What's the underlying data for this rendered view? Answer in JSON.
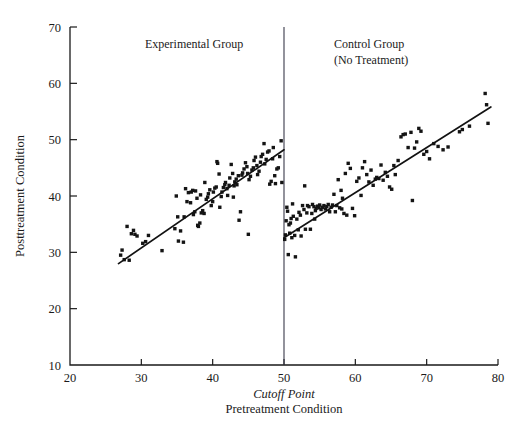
{
  "chart_data": {
    "type": "scatter",
    "title": "",
    "xlabel": "Pretreatment Condition",
    "ylabel": "Posttreatment Condition",
    "xlim": [
      20,
      80
    ],
    "ylim": [
      10,
      70
    ],
    "xticks": [
      20,
      30,
      40,
      50,
      60,
      70,
      80
    ],
    "yticks": [
      10,
      20,
      30,
      40,
      50,
      60,
      70
    ],
    "grid": false,
    "legend": "none",
    "cutoff": {
      "value": 50,
      "label": "Cutoff Point",
      "style": "italic",
      "color": "#3a3a4a"
    },
    "annotations": [
      {
        "text": "Experimental Group",
        "x": 30.5,
        "y": 66.2
      },
      {
        "text": "Control Group",
        "x": 57.0,
        "y": 66.2
      },
      {
        "text": "(No Treatment)",
        "x": 57.0,
        "y": 63.4
      }
    ],
    "marker": {
      "shape": "square",
      "size_px": 3.4,
      "color": "#141414"
    },
    "fit_lines": [
      {
        "name": "Experimental Group fit",
        "x0": 26.8,
        "y0": 28.0,
        "x1": 50.0,
        "y1": 48.2,
        "color": "#121212"
      },
      {
        "name": "Control Group fit",
        "x0": 50.0,
        "y0": 32.6,
        "x1": 79.0,
        "y1": 55.8,
        "color": "#121212"
      }
    ],
    "series": [
      {
        "name": "Experimental Group",
        "color": "#141414",
        "points": [
          [
            27.1,
            29.5
          ],
          [
            27.3,
            30.4
          ],
          [
            27.6,
            28.7
          ],
          [
            28.0,
            34.6
          ],
          [
            28.3,
            28.6
          ],
          [
            28.6,
            33.3
          ],
          [
            28.9,
            33.9
          ],
          [
            29.1,
            33.2
          ],
          [
            29.4,
            32.9
          ],
          [
            30.2,
            31.6
          ],
          [
            30.6,
            31.9
          ],
          [
            31.0,
            33.0
          ],
          [
            32.9,
            30.3
          ],
          [
            34.7,
            34.2
          ],
          [
            34.9,
            40.0
          ],
          [
            35.1,
            36.3
          ],
          [
            35.2,
            32.0
          ],
          [
            35.5,
            33.8
          ],
          [
            35.9,
            31.8
          ],
          [
            36.0,
            36.3
          ],
          [
            36.4,
            39.0
          ],
          [
            36.6,
            40.6
          ],
          [
            36.9,
            38.8
          ],
          [
            37.0,
            40.7
          ],
          [
            37.2,
            41.0
          ],
          [
            37.3,
            36.7
          ],
          [
            37.5,
            37.2
          ],
          [
            37.6,
            40.9
          ],
          [
            37.8,
            39.6
          ],
          [
            37.9,
            34.8
          ],
          [
            38.0,
            34.6
          ],
          [
            38.2,
            35.2
          ],
          [
            38.4,
            37.0
          ],
          [
            38.6,
            37.4
          ],
          [
            38.8,
            36.9
          ],
          [
            38.9,
            42.4
          ],
          [
            39.1,
            39.4
          ],
          [
            39.3,
            39.8
          ],
          [
            39.4,
            40.4
          ],
          [
            39.6,
            41.1
          ],
          [
            39.8,
            38.3
          ],
          [
            40.0,
            39.0
          ],
          [
            40.1,
            40.7
          ],
          [
            40.3,
            41.4
          ],
          [
            40.5,
            41.6
          ],
          [
            40.6,
            46.1
          ],
          [
            40.7,
            45.8
          ],
          [
            40.9,
            43.9
          ],
          [
            41.0,
            38.0
          ],
          [
            41.2,
            39.9
          ],
          [
            41.3,
            40.7
          ],
          [
            41.5,
            41.5
          ],
          [
            41.7,
            42.0
          ],
          [
            41.8,
            42.4
          ],
          [
            42.0,
            41.3
          ],
          [
            42.1,
            40.1
          ],
          [
            42.3,
            41.9
          ],
          [
            42.4,
            43.2
          ],
          [
            42.6,
            45.6
          ],
          [
            42.8,
            44.0
          ],
          [
            43.0,
            41.8
          ],
          [
            43.1,
            42.5
          ],
          [
            43.3,
            43.0
          ],
          [
            43.4,
            42.0
          ],
          [
            43.6,
            43.6
          ],
          [
            43.7,
            35.7
          ],
          [
            43.9,
            37.2
          ],
          [
            44.1,
            43.7
          ],
          [
            44.2,
            44.1
          ],
          [
            44.4,
            44.8
          ],
          [
            44.6,
            45.9
          ],
          [
            44.8,
            45.2
          ],
          [
            45.0,
            33.2
          ],
          [
            45.1,
            42.9
          ],
          [
            45.3,
            43.5
          ],
          [
            45.5,
            44.6
          ],
          [
            45.7,
            45.0
          ],
          [
            45.8,
            46.3
          ],
          [
            46.0,
            46.9
          ],
          [
            46.2,
            45.4
          ],
          [
            46.3,
            43.8
          ],
          [
            46.5,
            44.4
          ],
          [
            46.7,
            46.0
          ],
          [
            46.8,
            47.0
          ],
          [
            47.0,
            47.4
          ],
          [
            47.2,
            49.3
          ],
          [
            47.3,
            45.7
          ],
          [
            47.5,
            46.5
          ],
          [
            47.7,
            47.8
          ],
          [
            47.9,
            48.0
          ],
          [
            48.0,
            42.1
          ],
          [
            48.2,
            42.6
          ],
          [
            48.4,
            46.6
          ],
          [
            48.5,
            48.6
          ],
          [
            48.7,
            43.6
          ],
          [
            48.8,
            42.2
          ],
          [
            49.0,
            44.8
          ],
          [
            49.2,
            45.0
          ],
          [
            49.4,
            47.0
          ],
          [
            49.6,
            49.8
          ],
          [
            49.7,
            42.4
          ],
          [
            36.2,
            41.3
          ],
          [
            38.3,
            40.2
          ],
          [
            42.9,
            39.8
          ],
          [
            44.9,
            44.0
          ]
        ]
      },
      {
        "name": "Control Group (No Treatment)",
        "color": "#141414",
        "points": [
          [
            50.1,
            32.3
          ],
          [
            50.2,
            33.1
          ],
          [
            50.3,
            35.6
          ],
          [
            50.4,
            38.0
          ],
          [
            50.5,
            37.3
          ],
          [
            50.6,
            29.6
          ],
          [
            50.8,
            33.4
          ],
          [
            50.9,
            35.2
          ],
          [
            51.0,
            36.0
          ],
          [
            51.2,
            38.6
          ],
          [
            51.3,
            36.4
          ],
          [
            51.5,
            33.0
          ],
          [
            51.6,
            29.2
          ],
          [
            51.8,
            35.9
          ],
          [
            52.0,
            34.0
          ],
          [
            52.1,
            37.1
          ],
          [
            52.3,
            36.6
          ],
          [
            52.4,
            32.9
          ],
          [
            52.6,
            38.3
          ],
          [
            52.8,
            37.6
          ],
          [
            53.0,
            34.1
          ],
          [
            53.2,
            37.0
          ],
          [
            53.3,
            38.3
          ],
          [
            53.5,
            38.1
          ],
          [
            53.7,
            34.1
          ],
          [
            53.9,
            36.9
          ],
          [
            54.0,
            38.5
          ],
          [
            54.2,
            38.1
          ],
          [
            54.4,
            37.4
          ],
          [
            54.5,
            37.8
          ],
          [
            54.7,
            38.2
          ],
          [
            54.9,
            37.9
          ],
          [
            55.0,
            38.4
          ],
          [
            55.2,
            37.6
          ],
          [
            55.4,
            38.0
          ],
          [
            55.6,
            38.3
          ],
          [
            55.8,
            37.7
          ],
          [
            56.0,
            38.1
          ],
          [
            56.2,
            38.5
          ],
          [
            56.4,
            37.2
          ],
          [
            56.6,
            38.0
          ],
          [
            56.8,
            38.4
          ],
          [
            57.0,
            40.3
          ],
          [
            57.2,
            37.2
          ],
          [
            57.4,
            38.3
          ],
          [
            57.6,
            42.9
          ],
          [
            57.8,
            37.9
          ],
          [
            58.0,
            41.0
          ],
          [
            58.2,
            39.6
          ],
          [
            58.4,
            36.9
          ],
          [
            58.6,
            44.0
          ],
          [
            58.8,
            36.6
          ],
          [
            59.0,
            45.8
          ],
          [
            59.3,
            44.9
          ],
          [
            59.6,
            37.8
          ],
          [
            59.9,
            36.5
          ],
          [
            60.2,
            42.6
          ],
          [
            60.5,
            43.2
          ],
          [
            60.8,
            40.1
          ],
          [
            61.0,
            45.0
          ],
          [
            61.3,
            46.1
          ],
          [
            61.6,
            43.8
          ],
          [
            61.9,
            42.5
          ],
          [
            62.2,
            44.6
          ],
          [
            62.5,
            41.9
          ],
          [
            62.8,
            43.0
          ],
          [
            63.0,
            43.3
          ],
          [
            63.3,
            43.1
          ],
          [
            63.6,
            45.5
          ],
          [
            63.9,
            42.8
          ],
          [
            64.2,
            44.2
          ],
          [
            64.5,
            43.5
          ],
          [
            64.8,
            41.6
          ],
          [
            65.1,
            41.2
          ],
          [
            65.4,
            45.4
          ],
          [
            65.6,
            43.8
          ],
          [
            66.0,
            46.3
          ],
          [
            66.4,
            50.5
          ],
          [
            66.7,
            50.9
          ],
          [
            67.0,
            51.0
          ],
          [
            67.4,
            48.6
          ],
          [
            67.8,
            51.3
          ],
          [
            68.0,
            39.2
          ],
          [
            68.3,
            48.5
          ],
          [
            68.6,
            49.6
          ],
          [
            68.9,
            52.0
          ],
          [
            69.2,
            51.5
          ],
          [
            69.6,
            47.4
          ],
          [
            70.0,
            47.9
          ],
          [
            70.4,
            46.6
          ],
          [
            71.0,
            49.3
          ],
          [
            71.6,
            48.8
          ],
          [
            72.3,
            48.2
          ],
          [
            73.0,
            48.7
          ],
          [
            74.6,
            51.4
          ],
          [
            75.0,
            51.8
          ],
          [
            76.0,
            52.4
          ],
          [
            78.2,
            58.2
          ],
          [
            78.4,
            56.2
          ],
          [
            78.6,
            52.9
          ],
          [
            52.9,
            41.8
          ],
          [
            54.3,
            35.9
          ],
          [
            50.7,
            34.9
          ],
          [
            51.1,
            32.6
          ],
          [
            58.1,
            37.7
          ]
        ]
      }
    ]
  }
}
